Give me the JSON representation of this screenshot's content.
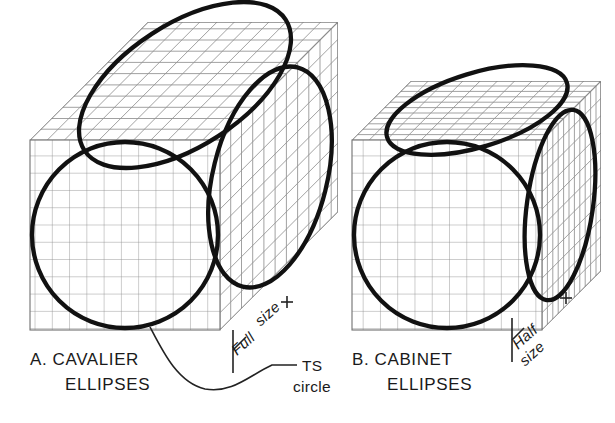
{
  "figure": {
    "title_implicit": "Cavalier and Cabinet oblique ellipses",
    "background_color": "#ffffff",
    "ink_color": "#111111",
    "grid_color": "#8a8a8a",
    "outline_color": "#555555",
    "thick_stroke_width": 4.2,
    "grid_stroke_width": 0.8
  },
  "labels": {
    "left_caption_line1": "A.  CAVALIER",
    "left_caption_line2": "ELLIPSES",
    "right_caption_line1": "B.  CABINET",
    "right_caption_line2": "ELLIPSES",
    "leader_line1": "TS",
    "leader_line2": "circle",
    "left_dimension_line1": "Full",
    "left_dimension_line2": "size",
    "right_dimension_line1": "Half",
    "right_dimension_line2": "size"
  },
  "diagrams": [
    {
      "id": "cavalier",
      "name": "Cavalier oblique box",
      "depth_scale": "full",
      "receding_angle_deg": 45,
      "front_face": {
        "x": 30,
        "y": 140,
        "width": 190,
        "height": 190,
        "grid_cells_x": 11,
        "grid_cells_y": 11
      },
      "depth_offset": {
        "dx": 118,
        "dy": -118
      },
      "ellipses": [
        {
          "face": "front",
          "shape": "true-size-circle",
          "cx": 125,
          "cy": 235,
          "rx": 93,
          "ry": 93,
          "rotation": 0
        },
        {
          "face": "top",
          "shape": "ellipse",
          "cx": 185,
          "cy": 85,
          "rx": 118,
          "ry": 60,
          "rotation": -33
        },
        {
          "face": "side",
          "shape": "ellipse",
          "cx": 269,
          "cy": 178,
          "rx": 56,
          "ry": 112,
          "rotation": 14
        }
      ]
    },
    {
      "id": "cabinet",
      "name": "Cabinet oblique box",
      "depth_scale": "half",
      "receding_angle_deg": 45,
      "front_face": {
        "x": 352,
        "y": 140,
        "width": 190,
        "height": 190,
        "grid_cells_x": 11,
        "grid_cells_y": 11
      },
      "depth_offset": {
        "dx": 59,
        "dy": -59
      },
      "ellipses": [
        {
          "face": "front",
          "shape": "true-size-circle",
          "cx": 447,
          "cy": 235,
          "rx": 93,
          "ry": 93,
          "rotation": 0
        },
        {
          "face": "top",
          "shape": "ellipse",
          "cx": 476,
          "cy": 110,
          "rx": 92,
          "ry": 36,
          "rotation": -18
        },
        {
          "face": "side",
          "shape": "ellipse",
          "cx": 559,
          "cy": 205,
          "rx": 32,
          "ry": 95,
          "rotation": 8
        }
      ]
    }
  ],
  "annotations": {
    "ts_circle_leader": {
      "from_x": 148,
      "from_y": 325,
      "to_x": 272,
      "to_y": 364,
      "description": "curved leader from front circle to TS circle label"
    },
    "left_dimension": {
      "x1": 232,
      "y1": 330,
      "x2": 232,
      "y2": 372,
      "label_rotation_deg": -42
    },
    "right_dimension": {
      "x1": 543,
      "y1": 320,
      "x2": 543,
      "y2": 362,
      "label_rotation_deg": -42
    }
  }
}
